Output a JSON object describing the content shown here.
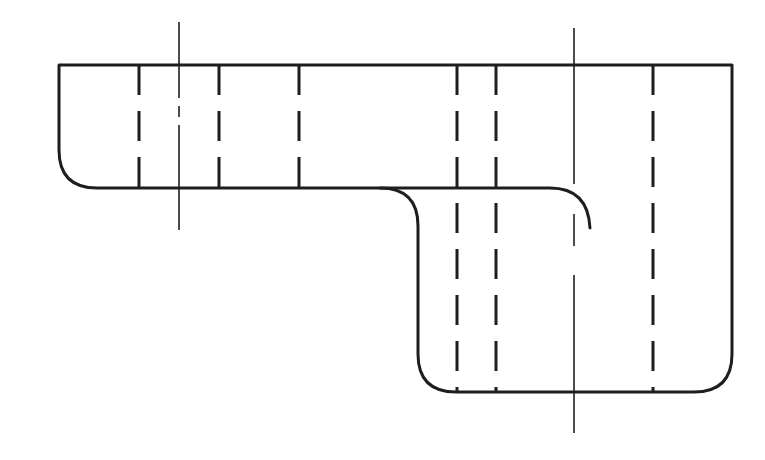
{
  "diagram": {
    "type": "engineering-drawing",
    "view": "front-view",
    "line_color": "#1e1e1e",
    "background": "#ffffff",
    "outline": {
      "top_y": 65,
      "left_x": 59,
      "right_x": 732,
      "upper_bottom_y": 188,
      "lower_left_x": 418,
      "lower_bottom_y": 392,
      "corner_radius": 38
    },
    "hidden_lines_upper": [
      139,
      219,
      299
    ],
    "hidden_lines_full": [
      457,
      496,
      653
    ],
    "center_lines": [
      {
        "x": 179,
        "y1": 22,
        "y2": 230
      },
      {
        "x": 574,
        "y1": 28,
        "y2": 433
      }
    ],
    "notch_arc": {
      "start_x": 550,
      "y": 188,
      "end_x": 590,
      "end_y": 228
    }
  }
}
